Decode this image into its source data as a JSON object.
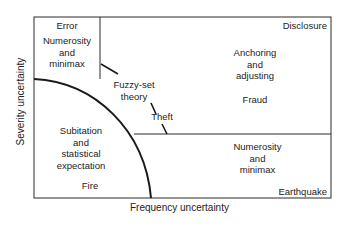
{
  "diagram": {
    "axes": {
      "x_label": "Frequency uncertainty",
      "y_label": "Severity uncertainty"
    },
    "regions": {
      "top_left": {
        "title": "Error",
        "method": [
          "Numerosity",
          "and",
          "minimax"
        ]
      },
      "top_right": {
        "corner": "Disclosure",
        "method": [
          "Anchoring",
          "and",
          "adjusting"
        ],
        "example": "Fraud"
      },
      "middle": {
        "method": [
          "Fuzzy-set",
          "theory"
        ],
        "example": "Theft"
      },
      "bottom_left": {
        "method": [
          "Subitation",
          "and",
          "statistical",
          "expectation"
        ],
        "example": "Fire"
      },
      "bottom_right": {
        "method": [
          "Numerosity",
          "and",
          "minimax"
        ],
        "corner": "Earthquake"
      }
    },
    "colors": {
      "line": "#2a2a2a",
      "background": "#ffffff",
      "text": "#222222"
    }
  }
}
